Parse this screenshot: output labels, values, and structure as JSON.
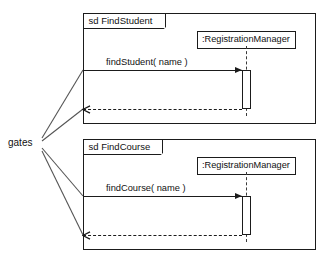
{
  "diagram": {
    "type": "uml-sequence-diagram",
    "gates_label": "gates",
    "frames": [
      {
        "id": "find-student",
        "tab_label": "sd FindStudent",
        "lifeline_name": ":RegistrationManager",
        "call_message": "findStudent( name )",
        "return_message": "",
        "geometry": {
          "x": 83,
          "y": 13,
          "w": 233,
          "h": 111,
          "tab_w": 82,
          "tab_h": 15,
          "head_x": 197,
          "head_y": 31,
          "head_w": 99,
          "lifeline_x": 246,
          "lifeline_top": 46,
          "lifeline_bottom": 116,
          "act_x": 242,
          "act_y": 70,
          "act_w": 9,
          "act_h": 39,
          "call_y": 70,
          "return_y": 109,
          "label_x": 106,
          "label_y": 57
        }
      },
      {
        "id": "find-course",
        "tab_label": "sd FindCourse",
        "lifeline_name": ":RegistrationManager",
        "call_message": "findCourse( name )",
        "return_message": "",
        "geometry": {
          "x": 83,
          "y": 139,
          "w": 233,
          "h": 111,
          "tab_w": 79,
          "tab_h": 15,
          "head_x": 197,
          "head_y": 157,
          "head_w": 99,
          "lifeline_x": 246,
          "lifeline_top": 172,
          "lifeline_bottom": 242,
          "act_x": 242,
          "act_y": 196,
          "act_w": 9,
          "act_h": 39,
          "call_y": 196,
          "return_y": 235,
          "label_x": 106,
          "label_y": 183
        }
      }
    ],
    "gate_connectors": [
      {
        "name": "gate-findstudent-call",
        "x1": 42,
        "y1": 138,
        "x2": 83,
        "y2": 70
      },
      {
        "name": "gate-findstudent-return",
        "x1": 42,
        "y1": 141,
        "x2": 83,
        "y2": 109
      },
      {
        "name": "gate-findcourse-call",
        "x1": 42,
        "y1": 148,
        "x2": 83,
        "y2": 196
      },
      {
        "name": "gate-findcourse-return",
        "x1": 42,
        "y1": 151,
        "x2": 83,
        "y2": 235
      }
    ],
    "gates_label_pos": {
      "x": 8,
      "y": 137
    },
    "colors": {
      "stroke": "#1b1b1b",
      "lifeline_dash": "#3a3a3a",
      "background": "#ffffff",
      "text": "#111111"
    }
  }
}
